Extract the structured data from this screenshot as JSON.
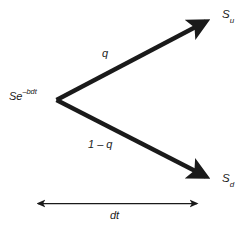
{
  "figure": {
    "type": "binomial-tree-diagram",
    "background_color": "#ffffff",
    "stroke_color": "#1a1a1a",
    "text_color": "#1a1a1a"
  },
  "nodes": {
    "root": {
      "label_base": "Se",
      "label_exponent": "–bdt",
      "full_text": "Se–bdt",
      "x": 56,
      "y": 100
    },
    "up": {
      "label_base": "S",
      "label_subscript": "u",
      "full_text": "Su",
      "x": 211,
      "y": 18
    },
    "down": {
      "label_base": "S",
      "label_subscript": "d",
      "full_text": "Sd",
      "x": 211,
      "y": 180
    }
  },
  "branches": [
    {
      "name": "up-branch",
      "probability_label": "q",
      "from": "root",
      "to": "up"
    },
    {
      "name": "down-branch",
      "probability_label": "1 – q",
      "from": "root",
      "to": "down"
    }
  ],
  "timestep": {
    "label": "dt",
    "start_x": 34,
    "end_x": 201,
    "y": 203
  }
}
